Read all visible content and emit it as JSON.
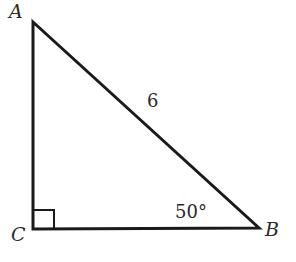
{
  "diagram": {
    "type": "right-triangle",
    "vertices": {
      "A": {
        "label": "A"
      },
      "B": {
        "label": "B"
      },
      "C": {
        "label": "C"
      }
    },
    "hypotenuse_label": "6",
    "angle_B_label": "50°",
    "right_angle_at": "C",
    "colors": {
      "stroke": "#1a1a1a",
      "text": "#2a2a2a",
      "background": "#ffffff"
    }
  }
}
